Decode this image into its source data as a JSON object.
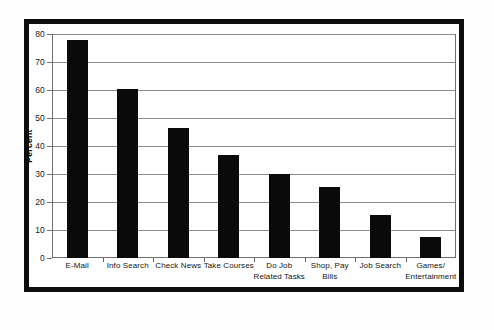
{
  "chart_data": {
    "type": "bar",
    "title": "",
    "xlabel": "",
    "ylabel": "Percent",
    "ylim": [
      0,
      80
    ],
    "yticks": [
      0,
      10,
      20,
      30,
      40,
      50,
      60,
      70,
      80
    ],
    "ytick_labels": [
      "0",
      "10",
      "20",
      "30",
      "40",
      "50",
      "60",
      "70",
      "80"
    ],
    "grid": true,
    "legend": "none",
    "bar_color": "#0a0a0a",
    "categories": [
      "E-Mail",
      "Info Search",
      "Check News",
      "Take Courses",
      "Do Job Related Tasks",
      "Shop, Pay Bills",
      "Job Search",
      "Games/ Entertainment"
    ],
    "category_lines": [
      [
        "E-Mail",
        ""
      ],
      [
        "Info Search",
        ""
      ],
      [
        "Check News",
        ""
      ],
      [
        "Take Courses",
        ""
      ],
      [
        "Do Job",
        "Related Tasks"
      ],
      [
        "Shop, Pay",
        "Bills"
      ],
      [
        "Job Search",
        ""
      ],
      [
        "Games/",
        "Entertainment"
      ]
    ],
    "values": [
      78,
      60.3,
      46.5,
      36.8,
      30,
      25.5,
      15.5,
      7.4
    ]
  }
}
